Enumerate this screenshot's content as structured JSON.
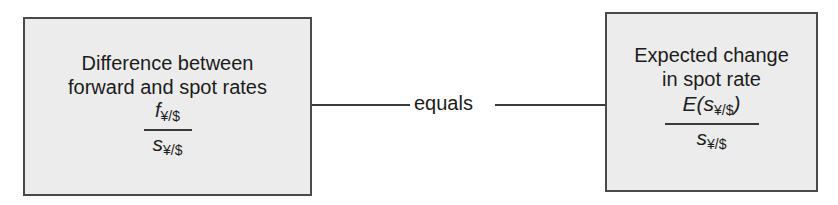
{
  "diagram": {
    "type": "equivalence-relation",
    "left_node": {
      "title_line1": "Difference between",
      "title_line2": "forward and spot rates",
      "formula": {
        "numerator_var": "f",
        "numerator_sub": "¥/$",
        "denominator_var": "s",
        "denominator_sub": "¥/$"
      }
    },
    "connector": {
      "label": "equals"
    },
    "right_node": {
      "title_line1": "Expected change",
      "title_line2": "in spot rate",
      "formula": {
        "numerator_prefix": "E(",
        "numerator_var": "s",
        "numerator_sub": "¥/$",
        "numerator_suffix": ")",
        "denominator_var": "s",
        "denominator_sub": "¥/$"
      }
    },
    "colors": {
      "box_fill": "#ececec",
      "box_border": "#4a4a4a",
      "line": "#3a3a3a",
      "text": "#1c1c1c"
    }
  }
}
